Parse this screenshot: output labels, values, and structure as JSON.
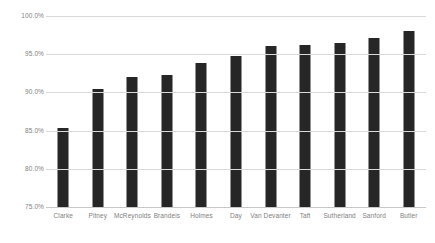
{
  "chart_data": {
    "type": "bar",
    "title": "",
    "xlabel": "",
    "ylabel": "",
    "ylim": [
      75.0,
      100.0
    ],
    "ytick_labels": [
      "75.0%",
      "80.0%",
      "85.0%",
      "90.0%",
      "95.0%",
      "100.0%"
    ],
    "ytick_values": [
      75.0,
      80.0,
      85.0,
      90.0,
      95.0,
      100.0
    ],
    "grid": "horizontal",
    "legend": "none",
    "bar_color": "#262626",
    "grid_color": "#d9d9d9",
    "tick_label_color": "#808080",
    "categories": [
      "Clarke",
      "Pitney",
      "McReynolds",
      "Brandeis",
      "Holmes",
      "Day",
      "Van Devanter",
      "Taft",
      "Sutherland",
      "Sanford",
      "Butler"
    ],
    "values": [
      85.4,
      90.5,
      92.0,
      92.3,
      93.9,
      94.8,
      96.1,
      96.2,
      96.5,
      97.1,
      98.1
    ]
  }
}
